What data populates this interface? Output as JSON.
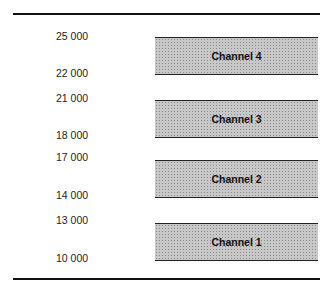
{
  "diagram": {
    "channels": [
      {
        "label": "Channel 4",
        "upper": "25 000",
        "lower": "22 000"
      },
      {
        "label": "Channel 3",
        "upper": "21 000",
        "lower": "18 000"
      },
      {
        "label": "Channel 2",
        "upper": "17 000",
        "lower": "14 000"
      },
      {
        "label": "Channel 1",
        "upper": "13 000",
        "lower": "10 000"
      }
    ]
  }
}
